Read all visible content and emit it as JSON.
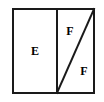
{
  "figure": {
    "background_color": "#ffffff",
    "stroke_color": "#1a1a1a",
    "fill_color": "#ffffff",
    "outer_rectangle": {
      "name": "outer-rectangle",
      "x": 13,
      "y": 9,
      "width": 81,
      "height": 84,
      "stroke_width": 2
    },
    "vertical_divider": {
      "name": "vertical-divider",
      "x1": 57,
      "y1": 9,
      "x2": 57,
      "y2": 93,
      "stroke_width": 2
    },
    "diagonal_divider": {
      "name": "diagonal-divider",
      "x1": 57,
      "y1": 93,
      "x2": 94,
      "y2": 9,
      "stroke_width": 2
    },
    "labels": [
      {
        "id": "label-e",
        "text": "E",
        "x": 35,
        "y": 51
      },
      {
        "id": "label-f-upper",
        "text": "F",
        "x": 70,
        "y": 31
      },
      {
        "id": "label-f-lower",
        "text": "F",
        "x": 84,
        "y": 71
      }
    ]
  }
}
